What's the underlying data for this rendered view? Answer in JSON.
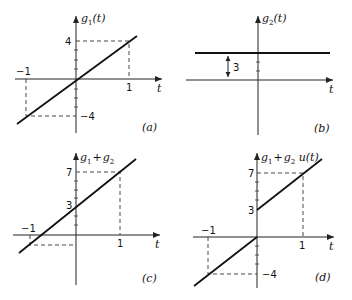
{
  "panels": [
    {
      "id": "a",
      "caption": "(a)",
      "ylabel": {
        "g": "g",
        "sub": "1",
        "arg": "(t)"
      },
      "xlabel": "t",
      "ticks": {
        "x_pos": "1",
        "x_neg": "−1",
        "y_pos": "4",
        "y_neg": "−4"
      }
    },
    {
      "id": "b",
      "caption": "(b)",
      "ylabel": {
        "g": "g",
        "sub": "2",
        "arg": "(t)"
      },
      "xlabel": "t",
      "annotation": "3"
    },
    {
      "id": "c",
      "caption": "(c)",
      "ylabel": {
        "g1": "g",
        "sub1": "1",
        "plus": "+",
        "g2": "g",
        "sub2": "2"
      },
      "xlabel": "t",
      "ticks": {
        "x_pos": "1",
        "x_neg": "−1",
        "y_top": "7",
        "y_mid": "3"
      }
    },
    {
      "id": "d",
      "caption": "(d)",
      "ylabel": {
        "g1": "g",
        "sub1": "1",
        "plus": "+",
        "g2": "g",
        "sub2": "2",
        "u": " u(t)"
      },
      "xlabel": "t",
      "ticks": {
        "x_pos": "1",
        "x_neg": "−1",
        "y_top": "7",
        "y_mid": "3",
        "y_neg": "−4"
      }
    }
  ]
}
